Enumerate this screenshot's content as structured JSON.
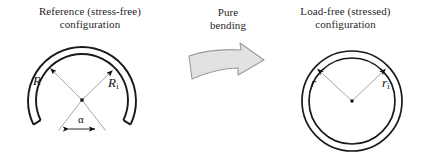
{
  "figure": {
    "width": 429,
    "height": 164,
    "background": "#ffffff"
  },
  "left_panel": {
    "caption": "Reference (stress-free)\nconfiguration",
    "shape_name": "open-ring-c-shape",
    "labels": {
      "outer_radius": "R",
      "inner_radius": "R",
      "inner_radius_subscript": "i",
      "opening_angle": "α"
    },
    "geometry": {
      "center_x": 82,
      "center_y": 100,
      "outer_radius": 54,
      "inner_radius": 46,
      "gap_half_angle_deg": 26
    }
  },
  "center_panel": {
    "caption": "Pure\nbending",
    "arrow_name": "pure-bending-arrow",
    "arrow_fill": "#e2e2e2",
    "arrow_stroke": "#9a9a9a"
  },
  "right_panel": {
    "caption": "Load-free (stressed)\nconfiguration",
    "shape_name": "closed-ring-annulus",
    "labels": {
      "outer_radius": "r",
      "inner_radius": "r",
      "inner_radius_subscript": "i"
    },
    "geometry": {
      "center_x": 352,
      "center_y": 101,
      "outer_radius": 50,
      "inner_radius": 43
    }
  },
  "colors": {
    "ring_stroke": "#1a1a1a",
    "leader_line": "#8e8e8e",
    "arrowhead": "#111111",
    "center_dot": "#111111",
    "text": "#1f1f1f"
  }
}
